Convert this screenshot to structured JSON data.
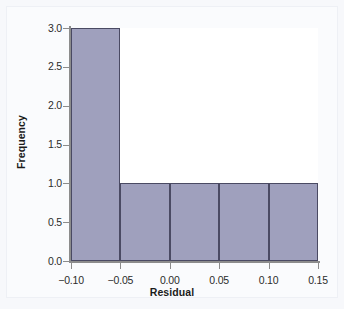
{
  "chart_data": {
    "type": "bar",
    "title": "",
    "subtitle": "",
    "xlabel": "Residual",
    "ylabel": "Frequency",
    "xlim": [
      -0.1,
      0.15
    ],
    "ylim": [
      0.0,
      3.0
    ],
    "grid": false,
    "legend": null,
    "bin_width": 0.05,
    "x_ticks": [
      "−0.10",
      "−0.05",
      "0.00",
      "0.05",
      "0.10",
      "0.15"
    ],
    "x_tick_values": [
      -0.1,
      -0.05,
      0.0,
      0.05,
      0.1,
      0.15
    ],
    "y_ticks": [
      "0.0",
      "0.5",
      "1.0",
      "1.5",
      "2.0",
      "2.5",
      "3.0"
    ],
    "y_tick_values": [
      0.0,
      0.5,
      1.0,
      1.5,
      2.0,
      2.5,
      3.0
    ],
    "categories": [
      "-0.10 to -0.05",
      "-0.05 to 0.00",
      "0.00 to 0.05",
      "0.05 to 0.10",
      "0.10 to 0.15"
    ],
    "bins": [
      {
        "label": "-0.10 to -0.05",
        "left": -0.1,
        "right": -0.05,
        "value": 3
      },
      {
        "label": "-0.05 to 0.00",
        "left": -0.05,
        "right": 0.0,
        "value": 1
      },
      {
        "label": "0.00 to 0.05",
        "left": 0.0,
        "right": 0.05,
        "value": 1
      },
      {
        "label": "0.05 to 0.10",
        "left": 0.05,
        "right": 0.1,
        "value": 1
      },
      {
        "label": "0.10 to 0.15",
        "left": 0.1,
        "right": 0.15,
        "value": 1
      }
    ],
    "values": [
      3,
      1,
      1,
      1,
      1
    ],
    "total_count": 7
  },
  "style": {
    "bar_fill": "#9fa0bd",
    "bar_edge": "#4a4a63",
    "axis_color": "#8c8c8c",
    "text_color": "#1b1b1b",
    "background": "#f7f8fb",
    "plot_background": "#ffffff"
  }
}
